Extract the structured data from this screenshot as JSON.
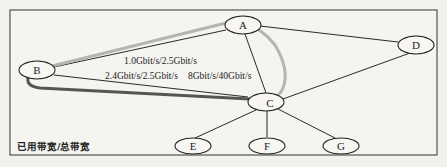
{
  "diagram": {
    "nodes": [
      {
        "id": "A",
        "label": "A",
        "cx": 243,
        "cy": 25
      },
      {
        "id": "B",
        "label": "B",
        "cx": 37,
        "cy": 70
      },
      {
        "id": "C",
        "label": "C",
        "cx": 266,
        "cy": 102
      },
      {
        "id": "D",
        "label": "D",
        "cx": 416,
        "cy": 45
      },
      {
        "id": "E",
        "label": "E",
        "cx": 193,
        "cy": 146
      },
      {
        "id": "F",
        "label": "F",
        "cx": 267,
        "cy": 146
      },
      {
        "id": "G",
        "label": "G",
        "cx": 341,
        "cy": 146
      }
    ],
    "edges": [
      {
        "from": "A",
        "to": "B"
      },
      {
        "from": "A",
        "to": "C"
      },
      {
        "from": "A",
        "to": "D"
      },
      {
        "from": "B",
        "to": "C"
      },
      {
        "from": "C",
        "to": "D"
      },
      {
        "from": "C",
        "to": "E"
      },
      {
        "from": "C",
        "to": "F"
      },
      {
        "from": "C",
        "to": "G"
      }
    ],
    "paths": [
      {
        "name": "light-path-b-a-c",
        "route": [
          "B",
          "A",
          "C"
        ],
        "color": "#b4b4b4"
      },
      {
        "name": "dark-path-b-c",
        "route": [
          "B",
          "C"
        ],
        "color": "#555555"
      }
    ],
    "edge_labels": {
      "ab": "1.0Gbit/s/2.5Gbit/s",
      "bc": "2.4Gbit/s/2.5Gbit/s",
      "ac": "8Gbit/s/40Gbit/s"
    },
    "legend": "已用带宽/总带宽"
  }
}
